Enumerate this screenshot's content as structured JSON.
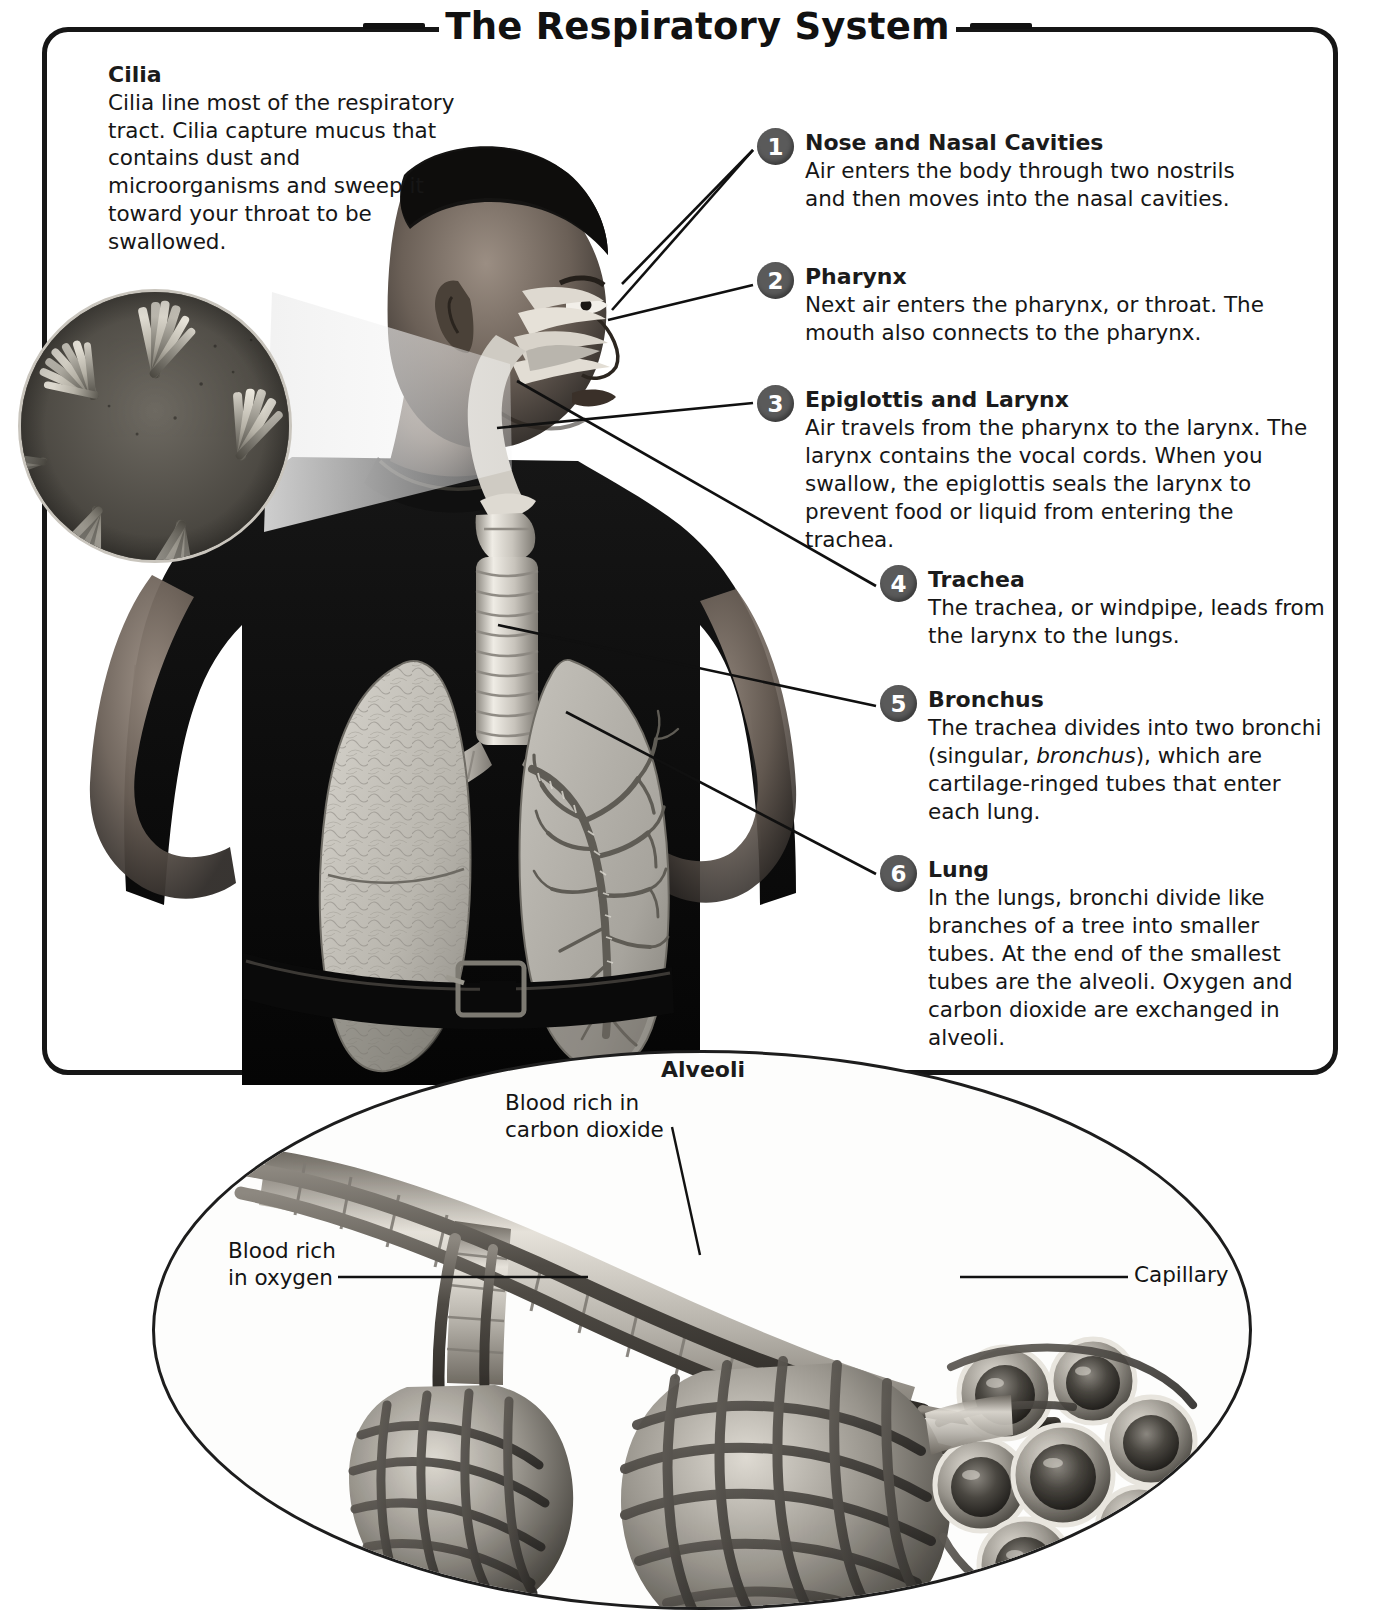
{
  "title": "The Respiratory System",
  "cilia": {
    "heading": "Cilia",
    "body": "Cilia line most of the respiratory tract. Cilia capture mucus that contains dust and microorganisms and sweep it toward your throat to be swallowed."
  },
  "callouts": [
    {
      "number": "1",
      "heading": "Nose and Nasal Cavities",
      "body": "Air enters the body through two nostrils and then moves into the nasal cavities."
    },
    {
      "number": "2",
      "heading": "Pharynx",
      "body": "Next air enters the pharynx, or throat. The mouth also connects to the pharynx."
    },
    {
      "number": "3",
      "heading": "Epiglottis and Larynx",
      "body": "Air travels from the pharynx to the larynx. The larynx contains the vocal cords. When you swallow, the epiglottis seals the larynx to prevent food or liquid from entering the trachea."
    },
    {
      "number": "4",
      "heading": "Trachea",
      "body": "The trachea, or windpipe, leads from the larynx to the lungs."
    },
    {
      "number": "5",
      "heading": "Bronchus",
      "body_pre": "The trachea divides into two bronchi (singular, ",
      "body_italic": "bronchus",
      "body_post": "), which are cartilage-ringed tubes that enter each lung."
    },
    {
      "number": "6",
      "heading": "Lung",
      "body": "In the lungs, bronchi divide like branches of a tree into smaller tubes. At the end of the smallest tubes are the alveoli. Oxygen and carbon dioxide are exchanged in alveoli."
    }
  ],
  "alveoli": {
    "title": "Alveoli",
    "label_co2": "Blood rich in\ncarbon dioxide",
    "label_o2": "Blood rich\nin oxygen",
    "label_capillary": "Capillary"
  },
  "colors": {
    "ink": "#161616",
    "frame": "#161616",
    "badge": "#5a5a5a",
    "badge_text": "#ffffff",
    "page": "#ffffff"
  }
}
